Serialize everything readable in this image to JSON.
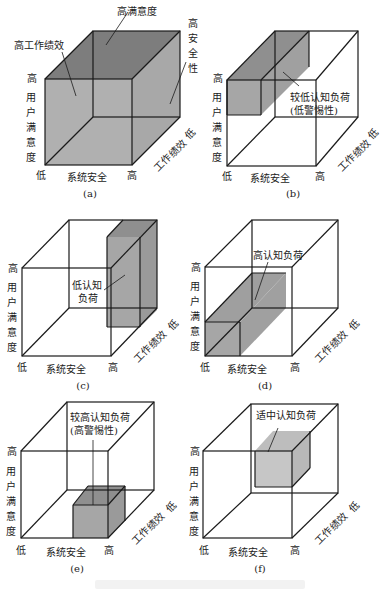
{
  "axes": {
    "y_high": "高",
    "y_label": "用户满意度",
    "x_low": "低",
    "x_label": "系统安全",
    "x_high": "高",
    "z_label": "工作绩效",
    "z_low": "低"
  },
  "panels": [
    {
      "id": "a",
      "caption": "(a)",
      "annotations": [
        "高满意度",
        "高工作绩效",
        "高安全性"
      ]
    },
    {
      "id": "b",
      "caption": "(b)",
      "annotations": [
        "较低认知负荷",
        "(低警惕性)"
      ]
    },
    {
      "id": "c",
      "caption": "(c)",
      "annotations": [
        "低认知",
        "负荷"
      ]
    },
    {
      "id": "d",
      "caption": "(d)",
      "annotations": [
        "高认知负荷"
      ]
    },
    {
      "id": "e",
      "caption": "(e)",
      "annotations": [
        "较高认知负荷",
        "(高警惕性)"
      ]
    },
    {
      "id": "f",
      "caption": "(f)",
      "annotations": [
        "适中认知负荷"
      ]
    }
  ],
  "colors": {
    "line": "#1a1a1a",
    "shade": "#a6a6a6",
    "shade_dark": "#7a7a7a",
    "shade_light": "#c4c4c4"
  }
}
